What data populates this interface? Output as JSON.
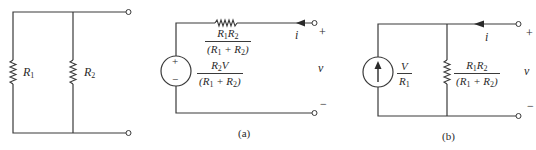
{
  "circuits": {
    "original": {
      "r1_label": "R",
      "r1_sub": "1",
      "r2_label": "R",
      "r2_sub": "2"
    },
    "a": {
      "caption": "(a)",
      "series_resistor": {
        "num_a": "R",
        "num_a_sub": "1",
        "num_b": "R",
        "num_b_sub": "2",
        "den": "(R",
        "den_sub1": "1",
        "den_mid": " + R",
        "den_sub2": "2",
        "den_end": ")"
      },
      "voltage_source": {
        "plus": "+",
        "minus": "−",
        "num": "R",
        "num_sub": "2",
        "num_tail": "V",
        "den": "(R",
        "den_sub1": "1",
        "den_mid": " + R",
        "den_sub2": "2",
        "den_end": ")"
      },
      "current_label": "i",
      "plus": "+",
      "voltage_label": "v",
      "minus": "−"
    },
    "b": {
      "caption": "(b)",
      "current_source": {
        "num": "V",
        "den": "R",
        "den_sub": "1"
      },
      "shunt_resistor": {
        "num_a": "R",
        "num_a_sub": "1",
        "num_b": "R",
        "num_b_sub": "2",
        "den": "(R",
        "den_sub1": "1",
        "den_mid": " + R",
        "den_sub2": "2",
        "den_end": ")"
      },
      "current_label": "i",
      "plus": "+",
      "voltage_label": "v",
      "minus": "−"
    }
  }
}
